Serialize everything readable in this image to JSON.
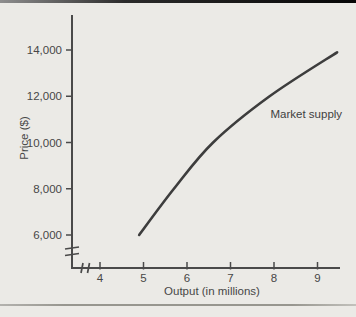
{
  "figure": {
    "background": "#ebeae6",
    "top_rule_color": "#060606",
    "bottom_rule_color": "#97968f"
  },
  "chart_data": {
    "type": "line",
    "title": "",
    "xlabel": "Output (in millions)",
    "ylabel": "Price ($)",
    "x_ticks": [
      4,
      5,
      6,
      7,
      8,
      9
    ],
    "x_tick_labels": [
      "4",
      "5",
      "6",
      "7",
      "8",
      "9"
    ],
    "y_ticks": [
      6000,
      8000,
      10000,
      12000,
      14000
    ],
    "y_tick_labels": [
      "6,000",
      "8,000",
      "10,000",
      "12,000",
      "14,000"
    ],
    "xlim": [
      4,
      9.5
    ],
    "ylim": [
      6000,
      14500
    ],
    "axis_break_x": true,
    "axis_break_y": true,
    "grid": false,
    "legend_position": "none",
    "axis_color": "#4a4a4a",
    "text_color": "#474747",
    "series": [
      {
        "name": "Market supply",
        "color": "#3d3d3d",
        "points": [
          {
            "x": 4.9,
            "y": 6000
          },
          {
            "x": 5.7,
            "y": 8000
          },
          {
            "x": 6.6,
            "y": 10000
          },
          {
            "x": 7.9,
            "y": 12000
          },
          {
            "x": 9.45,
            "y": 13900
          }
        ]
      }
    ],
    "annotation": {
      "text": "Market supply",
      "x": 7.92,
      "y": 11000,
      "anchor": "start"
    }
  }
}
